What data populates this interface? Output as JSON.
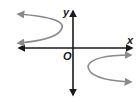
{
  "diagram": {
    "type": "coordinate-graph",
    "axes": {
      "x_label": "x",
      "y_label": "y",
      "origin_label": "O"
    },
    "curves": [
      {
        "name": "upper-left-branch",
        "quadrant": "II",
        "opens": "left"
      },
      {
        "name": "lower-right-branch",
        "quadrant": "IV",
        "opens": "right"
      }
    ],
    "colors": {
      "axes": "#1a1a1a",
      "curves": "#8a8a8a"
    }
  }
}
